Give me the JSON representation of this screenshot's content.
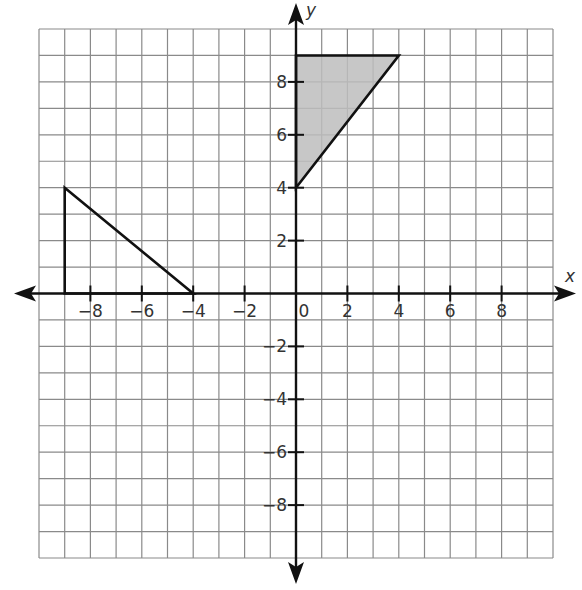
{
  "chart_data": {
    "type": "scatter",
    "title": "",
    "xlabel": "x",
    "ylabel": "y",
    "xlim": [
      -10,
      10
    ],
    "ylim": [
      -10,
      10
    ],
    "grid": true,
    "x_ticks": [
      -8,
      -6,
      -4,
      -2,
      0,
      2,
      4,
      6,
      8
    ],
    "x_tick_labels": [
      "−8",
      "−6",
      "−4",
      "−2",
      "0",
      "2",
      "4",
      "6",
      "8"
    ],
    "y_ticks": [
      -8,
      -6,
      -4,
      -2,
      2,
      4,
      6,
      8
    ],
    "y_tick_labels": [
      "−8",
      "−6",
      "−4",
      "−2",
      "2",
      "4",
      "6",
      "8"
    ],
    "shapes": [
      {
        "name": "shaded triangle",
        "vertices": [
          [
            0,
            9
          ],
          [
            4,
            9
          ],
          [
            0,
            4
          ]
        ],
        "fill": "#bdbdbd",
        "stroke": "#111111"
      },
      {
        "name": "unshaded triangle",
        "vertices": [
          [
            -9,
            4
          ],
          [
            -9,
            0
          ],
          [
            -4,
            0
          ]
        ],
        "fill": "none",
        "stroke": "#111111"
      }
    ]
  },
  "colors": {
    "grid": "#8a8a8a",
    "axis": "#111111",
    "shade": "#bdbdbd"
  }
}
